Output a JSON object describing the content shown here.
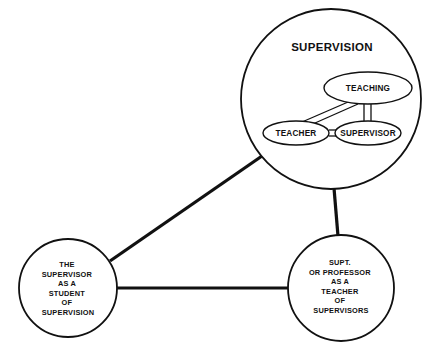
{
  "diagram": {
    "title_visible": "SUPERVISION",
    "background_color": "#ffffff",
    "line_color": "#111111",
    "nodes": {
      "supervision_circle": {
        "label": "SUPERVISION",
        "shape": "circle",
        "cx": 331,
        "cy": 99,
        "r": 90
      },
      "student_circle": {
        "shape": "circle",
        "cx": 68,
        "cy": 288,
        "r": 49,
        "lines": [
          "THE",
          "SUPERVISOR",
          "AS  A",
          "STUDENT",
          "OF",
          "SUPERVISION"
        ]
      },
      "teacher_of_supervisors_circle": {
        "shape": "circle",
        "cx": 341,
        "cy": 288,
        "r": 53,
        "lines": [
          "SUPT.",
          "OR  PROFESSOR",
          "AS  A",
          "TEACHER",
          "OF",
          "SUPERVISORS"
        ]
      }
    },
    "inner_nodes": {
      "teaching_ellipse": {
        "label": "TEACHING",
        "cx": 368,
        "cy": 88,
        "rx": 44,
        "ry": 16
      },
      "teacher_ellipse": {
        "label": "TEACHER",
        "cx": 296,
        "cy": 133,
        "rx": 33,
        "ry": 12
      },
      "supervisor_ellipse": {
        "label": "SUPERVISOR",
        "cx": 368,
        "cy": 133,
        "rx": 33,
        "ry": 12
      }
    },
    "edges": [
      {
        "name": "supervision-to-student",
        "from": "supervision_circle",
        "to": "student_circle",
        "style": "thick-line"
      },
      {
        "name": "supervision-to-teacher-of-supervisors",
        "from": "supervision_circle",
        "to": "teacher_of_supervisors_circle",
        "style": "thick-line"
      },
      {
        "name": "student-to-teacher-of-supervisors",
        "from": "student_circle",
        "to": "teacher_of_supervisors_circle",
        "style": "thick-line"
      }
    ],
    "inner_edges": [
      {
        "name": "teaching-to-supervisor",
        "from": "teaching_ellipse",
        "to": "supervisor_ellipse",
        "style": "double-line"
      },
      {
        "name": "teacher-to-supervisor",
        "from": "teacher_ellipse",
        "to": "supervisor_ellipse",
        "style": "double-line"
      },
      {
        "name": "teacher-to-teaching",
        "from": "teacher_ellipse",
        "to": "teaching_ellipse",
        "style": "double-line-diagonal"
      }
    ]
  }
}
